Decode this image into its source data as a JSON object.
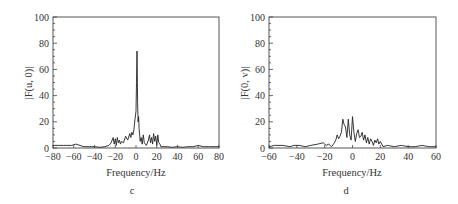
{
  "chart_data": [
    {
      "type": "line",
      "panel_label": "c",
      "title": "",
      "xlabel": "Frequency/Hz",
      "ylabel": "|F(u, 0)|",
      "xlim": [
        -80,
        80
      ],
      "ylim": [
        0,
        100
      ],
      "xticks": [
        -80,
        -60,
        -40,
        -20,
        0,
        20,
        40,
        60,
        80
      ],
      "yticks": [
        0,
        20,
        40,
        60,
        80,
        100
      ],
      "grid": false,
      "legend": null,
      "series": [
        {
          "name": "|F(u,0)|",
          "x": [
            -80,
            -70,
            -62,
            -58,
            -50,
            -45,
            -40,
            -35,
            -30,
            -26,
            -24,
            -22,
            -21,
            -20,
            -19,
            -18,
            -17,
            -16,
            -15,
            -14,
            -12,
            -10,
            -8,
            -6,
            -5,
            -4,
            -3,
            -2,
            -1,
            0,
            0.5,
            1,
            1.5,
            2,
            2.5,
            3,
            4,
            5,
            6,
            7,
            8,
            10,
            12,
            13,
            14,
            15,
            16,
            17,
            18,
            19,
            20,
            21,
            22,
            23,
            24,
            26,
            30,
            35,
            40,
            45,
            50,
            55,
            60,
            65,
            70,
            80
          ],
          "y": [
            2,
            2,
            2,
            3,
            1,
            1,
            1,
            0.5,
            1,
            2,
            4,
            8,
            3,
            7,
            2,
            8,
            4,
            6,
            3,
            5,
            4,
            9,
            6,
            11,
            8,
            12,
            10,
            14,
            22,
            28,
            50,
            74,
            35,
            20,
            24,
            15,
            5,
            8,
            3,
            10,
            4,
            2,
            6,
            10,
            4,
            8,
            3,
            11,
            5,
            9,
            2,
            10,
            4,
            3,
            1,
            1,
            1,
            0.5,
            1,
            0.5,
            1,
            1,
            2,
            1,
            1,
            1
          ]
        }
      ]
    },
    {
      "type": "line",
      "panel_label": "d",
      "title": "",
      "xlabel": "Frequency/Hz",
      "ylabel": "|F(0, v)|",
      "xlim": [
        -60,
        60
      ],
      "ylim": [
        0,
        100
      ],
      "xticks": [
        -60,
        -40,
        -20,
        0,
        20,
        40,
        60
      ],
      "yticks": [
        0,
        20,
        40,
        60,
        80,
        100
      ],
      "grid": false,
      "legend": null,
      "series": [
        {
          "name": "|F(0,v)|",
          "x": [
            -60,
            -56,
            -50,
            -45,
            -42,
            -38,
            -34,
            -30,
            -25,
            -21,
            -19,
            -17,
            -15,
            -13,
            -12,
            -11,
            -10,
            -9,
            -8,
            -7,
            -6,
            -5,
            -4,
            -3,
            -2,
            -1,
            0,
            1,
            2,
            3,
            4,
            5,
            6,
            7,
            8,
            9,
            10,
            11,
            12,
            13,
            14,
            15,
            16,
            17,
            18,
            19,
            20,
            22,
            25,
            30,
            35,
            40,
            45,
            50,
            55,
            60
          ],
          "y": [
            1,
            2,
            2,
            1,
            2,
            2,
            1,
            2,
            3,
            4,
            2,
            3,
            1,
            4,
            6,
            10,
            7,
            9,
            12,
            22,
            18,
            16,
            8,
            22,
            10,
            6,
            24,
            12,
            5,
            11,
            14,
            8,
            9,
            12,
            6,
            10,
            4,
            8,
            3,
            7,
            5,
            2,
            6,
            4,
            7,
            3,
            5,
            1,
            2,
            1,
            2,
            1,
            1,
            2,
            1,
            1
          ]
        }
      ]
    }
  ],
  "panels": {
    "left": {
      "label": "c",
      "ylabel": "|F(u, 0)|",
      "xlabel": "Frequency/Hz",
      "xtick_labels": [
        "−80",
        "−60",
        "−40",
        "−20",
        "0",
        "20",
        "40",
        "60",
        "80"
      ],
      "ytick_labels": [
        "0",
        "20",
        "40",
        "60",
        "80",
        "100"
      ]
    },
    "right": {
      "label": "d",
      "ylabel": "|F(0, v)|",
      "xlabel": "Frequency/Hz",
      "xtick_labels": [
        "−60",
        "−40",
        "−20",
        "0",
        "20",
        "40",
        "60"
      ],
      "ytick_labels": [
        "0",
        "20",
        "40",
        "60",
        "80",
        "100"
      ]
    }
  }
}
